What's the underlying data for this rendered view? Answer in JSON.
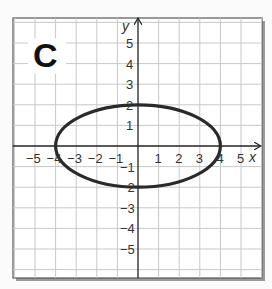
{
  "panel": {
    "label": "C",
    "x_axis_label": "x",
    "y_axis_label": "y",
    "x_ticks": [
      "−5",
      "−4",
      "−3",
      "−2",
      "−1",
      "1",
      "2",
      "3",
      "4",
      "5"
    ],
    "y_ticks": [
      "5",
      "4",
      "3",
      "2",
      "1",
      "−1",
      "−2",
      "−3",
      "−4",
      "−5"
    ]
  },
  "chart_data": {
    "type": "line",
    "title": "C",
    "xlabel": "x",
    "ylabel": "y",
    "xlim": [
      -6,
      6
    ],
    "ylim": [
      -6,
      6
    ],
    "grid": true,
    "series": [
      {
        "name": "ellipse",
        "equation": "x^2/16 + y^2/4 = 1",
        "center": [
          0,
          0
        ],
        "semi_major_x": 4,
        "semi_minor_y": 2,
        "key_points": [
          [
            4,
            0
          ],
          [
            -4,
            0
          ],
          [
            0,
            2
          ],
          [
            0,
            -2
          ]
        ]
      }
    ]
  },
  "colors": {
    "grid": "#c8c8c8",
    "axis": "#222222",
    "curve": "#2a2a2a",
    "frame": "#555555",
    "background": "#ffffff"
  }
}
